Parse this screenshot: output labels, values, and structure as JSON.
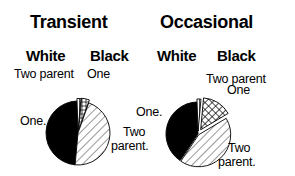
{
  "chart_data": [
    {
      "type": "pie",
      "title": "Transient",
      "group_labels": [
        "White",
        "Black"
      ],
      "slices": [
        {
          "name": "White One-parent",
          "label": "One.",
          "value": 48,
          "pattern": "solid"
        },
        {
          "name": "White Two-parent",
          "label": "Two parent",
          "value": 2,
          "pattern": "vertical"
        },
        {
          "name": "Black One-parent",
          "label": "One",
          "value": 4,
          "pattern": "grid"
        },
        {
          "name": "Black Two-parent",
          "label": "Two parent.",
          "value": 46,
          "pattern": "diagonal"
        }
      ]
    },
    {
      "type": "pie",
      "title": "Occasional",
      "group_labels": [
        "White",
        "Black"
      ],
      "slices": [
        {
          "name": "White One-parent",
          "label": "One.",
          "value": 40,
          "pattern": "solid"
        },
        {
          "name": "White Two-parent",
          "label": "Two parent",
          "value": 2,
          "pattern": "vertical"
        },
        {
          "name": "Black One-parent",
          "label": "One",
          "value": 15,
          "pattern": "crosshatch"
        },
        {
          "name": "Black Two-parent",
          "label": "Two parent.",
          "value": 43,
          "pattern": "diagonal"
        }
      ]
    }
  ],
  "labels": {
    "transient_title": "Transient",
    "occasional_title": "Occasional",
    "white": "White",
    "black": "Black",
    "two_parent": "Two parent",
    "one": "One",
    "one_dot": "One.",
    "two": "Two",
    "parent_dot": "parent."
  }
}
